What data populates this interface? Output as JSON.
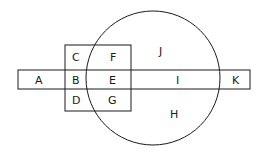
{
  "diagram": {
    "type": "venn-like region diagram",
    "shapes": {
      "rectangle": {
        "x": 18,
        "y": 70,
        "width": 232,
        "height": 19
      },
      "square": {
        "x": 65,
        "y": 45,
        "width": 66,
        "height": 66
      },
      "circle": {
        "cx": 153,
        "cy": 78,
        "r": 67
      }
    },
    "stroke_color": "#1a1a1a",
    "labels": {
      "A": "A",
      "B": "B",
      "C": "C",
      "D": "D",
      "E": "E",
      "F": "F",
      "G": "G",
      "H": "H",
      "I": "I",
      "J": "J",
      "K": "K"
    }
  }
}
